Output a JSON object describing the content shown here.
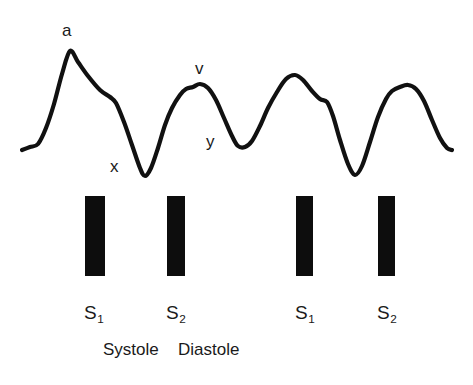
{
  "figure": {
    "background_color": "#ffffff",
    "stroke_color": "#111111",
    "bar_color": "#0d0d0d",
    "width": 473,
    "height": 385
  },
  "wave_labels": [
    {
      "name": "a-wave-label",
      "text": "a",
      "x": 62,
      "y": 22
    },
    {
      "name": "x-descent-label",
      "text": "x",
      "x": 110,
      "y": 158
    },
    {
      "name": "v-wave-label",
      "text": "v",
      "x": 195,
      "y": 60
    },
    {
      "name": "y-descent-label",
      "text": "y",
      "x": 206,
      "y": 133
    }
  ],
  "heart_sound_bars": [
    {
      "name": "s1-bar-1",
      "x": 85,
      "y": 196,
      "width": 20,
      "height": 80
    },
    {
      "name": "s2-bar-1",
      "x": 167,
      "y": 196,
      "width": 18,
      "height": 80
    },
    {
      "name": "s1-bar-2",
      "x": 296,
      "y": 196,
      "width": 17,
      "height": 80
    },
    {
      "name": "s2-bar-2",
      "x": 378,
      "y": 196,
      "width": 17,
      "height": 80
    }
  ],
  "sound_labels": [
    {
      "name": "sound-label-s1-1",
      "letter": "S",
      "subscript": "1",
      "x": 84,
      "y": 303
    },
    {
      "name": "sound-label-s2-1",
      "letter": "S",
      "subscript": "2",
      "x": 166,
      "y": 303
    },
    {
      "name": "sound-label-s1-2",
      "letter": "S",
      "subscript": "1",
      "x": 295,
      "y": 303
    },
    {
      "name": "sound-label-s2-2",
      "letter": "S",
      "subscript": "2",
      "x": 377,
      "y": 303
    }
  ],
  "phase_labels": [
    {
      "name": "phase-label-systole",
      "text": "Systole",
      "x": 103,
      "y": 341
    },
    {
      "name": "phase-label-diastole",
      "text": "Diastole",
      "x": 178,
      "y": 341
    }
  ],
  "chart_data": {
    "type": "line",
    "xlabel": "",
    "ylabel": "",
    "grid": false,
    "legend": null,
    "annotations": [
      "a",
      "x",
      "v",
      "y",
      "S1",
      "S2",
      "Systole",
      "Diastole"
    ],
    "series": [
      {
        "name": "jugular-venous-pulse",
        "description": "Continuous venous pressure tracing showing four cycles: a-wave peak, x-descent trough, v-wave peak, y-descent trough, repeated.",
        "points": [
          [
            22,
            150
          ],
          [
            30,
            147
          ],
          [
            38,
            144
          ],
          [
            46,
            128
          ],
          [
            54,
            104
          ],
          [
            62,
            74
          ],
          [
            70,
            51
          ],
          [
            78,
            62
          ],
          [
            88,
            76
          ],
          [
            100,
            90
          ],
          [
            110,
            97
          ],
          [
            116,
            103
          ],
          [
            124,
            122
          ],
          [
            132,
            145
          ],
          [
            140,
            168
          ],
          [
            145,
            176
          ],
          [
            151,
            168
          ],
          [
            158,
            148
          ],
          [
            165,
            125
          ],
          [
            172,
            108
          ],
          [
            180,
            95
          ],
          [
            186,
            89
          ],
          [
            193,
            87
          ],
          [
            200,
            84
          ],
          [
            208,
            88
          ],
          [
            216,
            100
          ],
          [
            224,
            118
          ],
          [
            232,
            136
          ],
          [
            238,
            146
          ],
          [
            245,
            147
          ],
          [
            252,
            141
          ],
          [
            260,
            126
          ],
          [
            268,
            108
          ],
          [
            277,
            92
          ],
          [
            286,
            79
          ],
          [
            295,
            75
          ],
          [
            303,
            80
          ],
          [
            312,
            91
          ],
          [
            320,
            99
          ],
          [
            327,
            102
          ],
          [
            333,
            116
          ],
          [
            340,
            140
          ],
          [
            348,
            164
          ],
          [
            355,
            175
          ],
          [
            362,
            166
          ],
          [
            370,
            142
          ],
          [
            378,
            117
          ],
          [
            386,
            99
          ],
          [
            392,
            91
          ],
          [
            400,
            87
          ],
          [
            408,
            85
          ],
          [
            416,
            89
          ],
          [
            424,
            101
          ],
          [
            432,
            120
          ],
          [
            440,
            138
          ],
          [
            447,
            148
          ],
          [
            452,
            150
          ]
        ]
      }
    ],
    "bars": {
      "name": "heart-sounds",
      "values": [
        "S1",
        "S2",
        "S1",
        "S2"
      ],
      "x_positions": [
        95,
        176,
        304,
        386
      ]
    }
  }
}
